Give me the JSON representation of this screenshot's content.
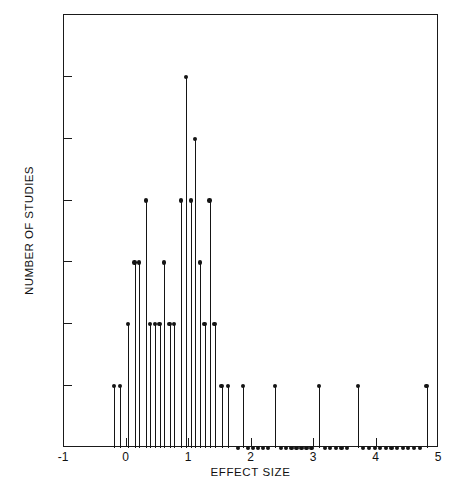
{
  "chart_data": {
    "type": "scatter",
    "plot_style": "stem",
    "title": "",
    "xlabel": "EFFECT SIZE",
    "ylabel": "NUMBER OF STUDIES",
    "xlim": [
      -1,
      5
    ],
    "ylim": [
      0,
      7
    ],
    "xticks": [
      -1,
      0,
      1,
      2,
      3,
      4,
      5
    ],
    "xtick_labels": [
      "-1",
      "0",
      "1",
      "2",
      "3",
      "4",
      "5"
    ],
    "yticks": [
      0,
      1,
      2,
      3,
      4,
      5,
      6,
      7
    ],
    "ytick_labels": [
      "0",
      "1",
      "2",
      "3",
      "4",
      "5",
      "6",
      "7"
    ],
    "grid": false,
    "legend": null,
    "marker_color": "#151515",
    "stem_color": "#151515",
    "frame_color": "#1a1a1a",
    "background": "#ffffff",
    "x": [
      -0.2,
      -0.1,
      0.02,
      0.13,
      0.2,
      0.31,
      0.38,
      0.46,
      0.53,
      0.6,
      0.69,
      0.76,
      0.87,
      0.95,
      1.03,
      1.1,
      1.18,
      1.25,
      1.33,
      1.41,
      1.52,
      1.62,
      1.78,
      1.86,
      1.95,
      2.03,
      2.11,
      2.19,
      2.27,
      2.38,
      2.47,
      2.55,
      2.64,
      2.72,
      2.8,
      2.88,
      2.96,
      3.08,
      3.17,
      3.26,
      3.35,
      3.44,
      3.53,
      3.7,
      3.79,
      3.88,
      3.97,
      4.06,
      4.15,
      4.24,
      4.33,
      4.42,
      4.51,
      4.6,
      4.69,
      4.8
    ],
    "y": [
      1,
      1,
      2,
      3,
      3,
      4,
      2,
      2,
      2,
      3,
      2,
      2,
      4,
      6,
      4,
      5,
      3,
      2,
      4,
      2,
      1,
      1,
      0,
      1,
      0,
      0,
      0,
      0,
      0,
      1,
      0,
      0,
      0,
      0,
      0,
      0,
      0,
      1,
      0,
      0,
      0,
      0,
      0,
      1,
      0,
      0,
      0,
      0,
      0,
      0,
      0,
      0,
      0,
      0,
      0,
      1
    ],
    "n_points": 56,
    "max_count": 6,
    "mode_effect_size": 0.95
  },
  "axes": {
    "x_label": "EFFECT SIZE",
    "y_label": "NUMBER OF STUDIES"
  }
}
